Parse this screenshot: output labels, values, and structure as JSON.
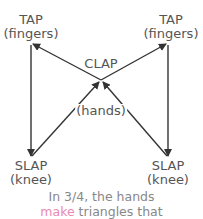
{
  "diagram": {
    "nodes": {
      "tap_left": {
        "title": "TAP",
        "subtitle": "(fingers)"
      },
      "tap_right": {
        "title": "TAP",
        "subtitle": "(fingers)"
      },
      "clap": {
        "title": "CLAP",
        "subtitle": "(hands)"
      },
      "slap_left": {
        "title": "SLAP",
        "subtitle": "(knee)"
      },
      "slap_right": {
        "title": "SLAP",
        "subtitle": "(knee)"
      }
    },
    "edges": [
      {
        "from": "tap_left",
        "to": "slap_left"
      },
      {
        "from": "slap_left",
        "to": "clap"
      },
      {
        "from": "clap",
        "to": "tap_right"
      },
      {
        "from": "tap_right",
        "to": "slap_right"
      },
      {
        "from": "slap_right",
        "to": "clap"
      },
      {
        "from": "clap",
        "to": "tap_left"
      }
    ],
    "caption": {
      "line1": "In 3/4, the hands",
      "line2_accent": "make",
      "line2_rest": " triangles that"
    },
    "colors": {
      "text": "#555555",
      "line": "#333333",
      "accent": "#e98bb0"
    }
  }
}
